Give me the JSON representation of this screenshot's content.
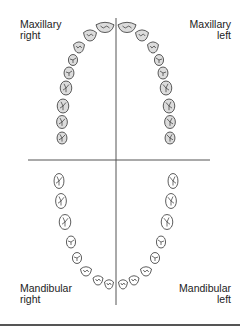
{
  "labels": {
    "maxillary_right": [
      "Maxillary",
      "right"
    ],
    "maxillary_left": [
      "Maxillary",
      "left"
    ],
    "mandibular_right": [
      "Mandibular",
      "right"
    ],
    "mandibular_left": [
      "Mandibular",
      "left"
    ]
  },
  "colors": {
    "upper_tooth_fill": "#dcdcdc",
    "lower_tooth_fill": "#ffffff",
    "outline": "#333333",
    "divider": "#555555"
  },
  "upper_teeth": [
    {
      "x": 105,
      "y": 27,
      "w": 18,
      "h": 11,
      "type": "incisor"
    },
    {
      "x": 90,
      "y": 35,
      "w": 13,
      "h": 12,
      "type": "incisor"
    },
    {
      "x": 79,
      "y": 47,
      "w": 11,
      "h": 12,
      "type": "canine"
    },
    {
      "x": 73,
      "y": 60,
      "w": 11,
      "h": 11,
      "type": "premolar"
    },
    {
      "x": 69,
      "y": 73,
      "w": 12,
      "h": 12,
      "type": "premolar"
    },
    {
      "x": 66,
      "y": 88,
      "w": 14,
      "h": 14,
      "type": "molar"
    },
    {
      "x": 63,
      "y": 106,
      "w": 14,
      "h": 14,
      "type": "molar"
    },
    {
      "x": 62,
      "y": 122,
      "w": 13,
      "h": 13,
      "type": "molar"
    },
    {
      "x": 62,
      "y": 138,
      "w": 12,
      "h": 12,
      "type": "molar"
    }
  ],
  "lower_teeth": [
    {
      "x": 59,
      "y": 181,
      "w": 12,
      "h": 15,
      "type": "molar"
    },
    {
      "x": 61,
      "y": 201,
      "w": 13,
      "h": 15,
      "type": "molar"
    },
    {
      "x": 65,
      "y": 222,
      "w": 14,
      "h": 15,
      "type": "molar"
    },
    {
      "x": 71,
      "y": 242,
      "w": 11,
      "h": 12,
      "type": "premolar"
    },
    {
      "x": 77,
      "y": 258,
      "w": 11,
      "h": 11,
      "type": "premolar"
    },
    {
      "x": 86,
      "y": 271,
      "w": 11,
      "h": 10,
      "type": "canine"
    },
    {
      "x": 98,
      "y": 280,
      "w": 10,
      "h": 10,
      "type": "incisor"
    },
    {
      "x": 109,
      "y": 284,
      "w": 9,
      "h": 10,
      "type": "incisor"
    }
  ],
  "lines": {
    "vertical": {
      "x": 116,
      "y1": 18,
      "y2": 305
    },
    "horizontal": {
      "y": 160,
      "x1": 28,
      "x2": 210
    },
    "bottom_rule_y": 325
  }
}
